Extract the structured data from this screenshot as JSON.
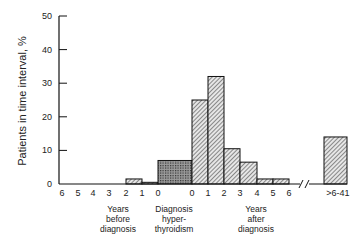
{
  "chart_data": {
    "type": "bar",
    "title": "",
    "ylabel": "Patients in time interval, %",
    "xlabel": "",
    "ylim": [
      0,
      50
    ],
    "yticks": [
      0,
      10,
      20,
      30,
      40,
      50
    ],
    "grid": false,
    "legend": null,
    "x_tick_labels": [
      "6",
      "5",
      "4",
      "3",
      "2",
      "1",
      "0",
      "0",
      "1",
      "2",
      "3",
      "4",
      "5",
      "6",
      ">6-41"
    ],
    "group_labels": [
      {
        "text": [
          "Years",
          "before",
          "diagnosis"
        ]
      },
      {
        "text": [
          "Diagnosis",
          "hyper-",
          "thyroidism"
        ]
      },
      {
        "text": [
          "Years",
          "after",
          "diagnosis"
        ]
      }
    ],
    "axis_break": "//",
    "bars": [
      {
        "interval": "6-5 years before",
        "value": 0,
        "pattern": "hatch"
      },
      {
        "interval": "5-4 years before",
        "value": 0,
        "pattern": "hatch"
      },
      {
        "interval": "4-3 years before",
        "value": 0,
        "pattern": "hatch"
      },
      {
        "interval": "3-2 years before",
        "value": 0,
        "pattern": "hatch"
      },
      {
        "interval": "2-1 years before",
        "value": 1.5,
        "pattern": "hatch"
      },
      {
        "interval": "1-0 years before",
        "value": 0.5,
        "pattern": "hatch"
      },
      {
        "interval": "Diagnosis hyperthyroidism",
        "value": 7,
        "pattern": "dots"
      },
      {
        "interval": "0-1 years after",
        "value": 25,
        "pattern": "hatch"
      },
      {
        "interval": "1-2 years after",
        "value": 32,
        "pattern": "hatch"
      },
      {
        "interval": "2-3 years after",
        "value": 10.5,
        "pattern": "hatch"
      },
      {
        "interval": "3-4 years after",
        "value": 6.5,
        "pattern": "hatch"
      },
      {
        "interval": "4-5 years after",
        "value": 1.5,
        "pattern": "hatch"
      },
      {
        "interval": "5-6 years after",
        "value": 1.5,
        "pattern": "hatch"
      },
      {
        "interval": ">6-41 years after",
        "value": 14,
        "pattern": "hatch"
      }
    ],
    "categories": [
      "6-5 before",
      "5-4 before",
      "4-3 before",
      "3-2 before",
      "2-1 before",
      "1-0 before",
      "Diagnosis",
      "0-1 after",
      "1-2 after",
      "2-3 after",
      "3-4 after",
      "4-5 after",
      "5-6 after",
      ">6-41 after"
    ],
    "values": [
      0,
      0,
      0,
      0,
      1.5,
      0.5,
      7,
      25,
      32,
      10.5,
      6.5,
      1.5,
      1.5,
      14
    ]
  }
}
